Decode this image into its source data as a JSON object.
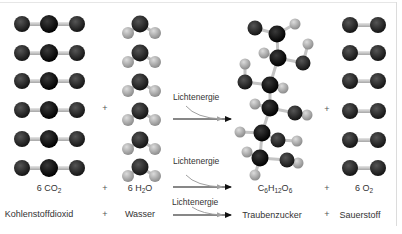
{
  "diagram": {
    "formula_row": {
      "reactant1": {
        "coef": "6 ",
        "base": "CO",
        "sub": "2"
      },
      "plus1": "+",
      "reactant2": {
        "coef": "6 ",
        "base": "H",
        "sub": "2",
        "tail": "O"
      },
      "arrow_label": "Lichtenergie",
      "product1": {
        "parts": [
          {
            "t": "C",
            "s": "6"
          },
          {
            "t": "H",
            "s": "12"
          },
          {
            "t": "O",
            "s": "6"
          }
        ]
      },
      "plus2": "+",
      "product2": {
        "coef": "6 ",
        "base": "O",
        "sub": "2"
      }
    },
    "word_row": {
      "reactant1": "Kohlenstoffdioxid",
      "plus1": "+",
      "reactant2": "Wasser",
      "arrow_label": "Lichtenergie",
      "product1": "Traubenzucker",
      "plus2": "+",
      "product2": "Sauerstoff"
    },
    "model_row": {
      "arrow_label": "Lichtenergie",
      "plus1": "+",
      "plus2": "+",
      "co2_count": 6,
      "h2o_count": 6,
      "o2_count": 6
    },
    "colors": {
      "carbon": "#0a0a0a",
      "oxygen": "#2a2a2a",
      "hydrogen": "#a8a8a8",
      "bond": "#c8c8c8",
      "arrow": "#111111",
      "energy_arrow": "#9a9a9a"
    }
  }
}
